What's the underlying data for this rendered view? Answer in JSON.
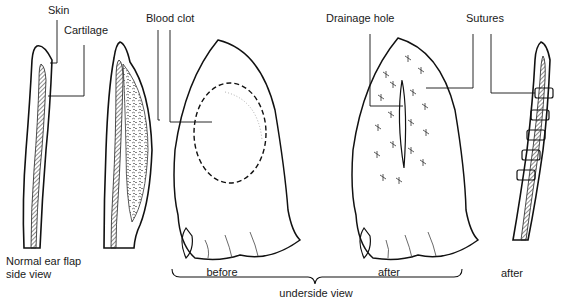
{
  "diagram": {
    "labels": {
      "skin": "Skin",
      "cartilage": "Cartilage",
      "blood_clot": "Blood clot",
      "drainage_hole": "Drainage hole",
      "sutures": "Sutures",
      "normal_line1": "Normal ear flap",
      "normal_line2": "side view",
      "before": "before",
      "after_underside": "after",
      "after_side": "after",
      "underside_view": "underside view"
    },
    "panels": [
      {
        "id": "normal-side",
        "caption": "Normal ear flap side view"
      },
      {
        "id": "swollen-side",
        "caption": ""
      },
      {
        "id": "underside-before",
        "caption": "before"
      },
      {
        "id": "underside-after",
        "caption": "after"
      },
      {
        "id": "sutured-side",
        "caption": "after"
      }
    ],
    "group_bracket": {
      "spans": [
        "underside-before",
        "underside-after"
      ],
      "label": "underside view"
    },
    "colors": {
      "ink": "#1a1a1a",
      "paper": "#ffffff"
    }
  }
}
